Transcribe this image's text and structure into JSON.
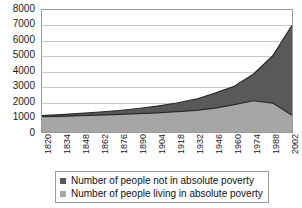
{
  "chart_data": {
    "type": "area",
    "stacked": true,
    "title": "",
    "subtitle": "",
    "xlabel": "",
    "ylabel": "",
    "xlim": [
      1820,
      2002
    ],
    "ylim": [
      0,
      8000
    ],
    "ytick_labels": [
      "0",
      "1000",
      "2000",
      "3000",
      "4000",
      "5000",
      "6000",
      "7000",
      "8000"
    ],
    "ytick_values": [
      0,
      1000,
      2000,
      3000,
      4000,
      5000,
      6000,
      7000,
      8000
    ],
    "xtick_labels": [
      "1820",
      "1834",
      "1848",
      "1862",
      "1876",
      "1890",
      "1904",
      "1918",
      "1932",
      "1946",
      "1960",
      "1974",
      "1988",
      "2002"
    ],
    "xtick_values": [
      1820,
      1834,
      1848,
      1862,
      1876,
      1890,
      1904,
      1918,
      1932,
      1946,
      1960,
      1974,
      1988,
      2002
    ],
    "grid": true,
    "legend_position": "bottom",
    "x": [
      1820,
      1834,
      1848,
      1862,
      1876,
      1890,
      1904,
      1918,
      1932,
      1946,
      1960,
      1974,
      1988,
      2002
    ],
    "series": [
      {
        "name": "Number of people living in absolute poverty",
        "color": "#a6a6a6",
        "values": [
          1000,
          1030,
          1070,
          1110,
          1150,
          1200,
          1260,
          1330,
          1420,
          1560,
          1800,
          2050,
          1900,
          1100
        ]
      },
      {
        "name": "Number of people not in absolute poverty",
        "color": "#595959",
        "values": [
          80,
          110,
          150,
          200,
          260,
          340,
          440,
          570,
          730,
          990,
          1200,
          1750,
          3100,
          5900
        ]
      }
    ],
    "totals": [
      1080,
      1140,
      1220,
      1310,
      1410,
      1540,
      1700,
      1900,
      2150,
      2550,
      3000,
      3800,
      5000,
      7000
    ],
    "colors": {
      "not_in_poverty": "#595959",
      "in_poverty": "#a6a6a6",
      "gridline": "#c8c8c8",
      "axis": "#9a9a9a",
      "text": "#1a1a1a"
    }
  },
  "legend": {
    "items": [
      {
        "label": "Number of people not in absolute poverty",
        "color": "#595959"
      },
      {
        "label": "Number of people living in absolute poverty",
        "color": "#a6a6a6"
      }
    ]
  }
}
